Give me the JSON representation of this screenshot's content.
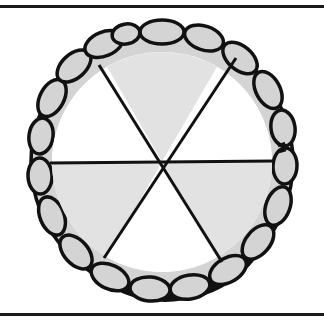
{
  "illustration": {
    "subject": "pie cut into six slices",
    "slice_count": 6,
    "colors": {
      "background": "#ffffff",
      "outline": "#111111",
      "crust_fill": "#d4d4d4",
      "filled_slice": "#e2e2e2",
      "empty_slice": "#ffffff",
      "shadow": "#111111"
    },
    "slices": [
      {
        "index": 0,
        "position": "top",
        "fill": "shaded"
      },
      {
        "index": 1,
        "position": "upper-right",
        "fill": "white"
      },
      {
        "index": 2,
        "position": "lower-right",
        "fill": "shaded"
      },
      {
        "index": 3,
        "position": "bottom",
        "fill": "white"
      },
      {
        "index": 4,
        "position": "lower-left",
        "fill": "shaded"
      },
      {
        "index": 5,
        "position": "upper-left",
        "fill": "white"
      }
    ]
  }
}
